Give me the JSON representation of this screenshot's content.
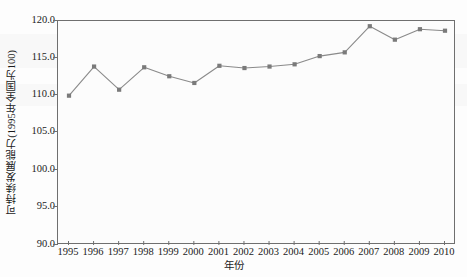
{
  "chart_data": {
    "type": "line",
    "title": "",
    "xlabel": "年份",
    "ylabel": "可持续发展能力(1995年全国为100)",
    "categories": [
      "1995",
      "1996",
      "1997",
      "1998",
      "1999",
      "2000",
      "2001",
      "2002",
      "2003",
      "2004",
      "2005",
      "2006",
      "2007",
      "2008",
      "2009",
      "2010"
    ],
    "values": [
      110.0,
      113.9,
      110.8,
      113.8,
      112.6,
      111.7,
      114.0,
      113.7,
      113.9,
      114.2,
      115.3,
      115.8,
      119.3,
      117.5,
      118.9,
      118.7
    ],
    "series": [
      {
        "name": "可持续发展能力",
        "values": [
          110.0,
          113.9,
          110.8,
          113.8,
          112.6,
          111.7,
          114.0,
          113.7,
          113.9,
          114.2,
          115.3,
          115.8,
          119.3,
          117.5,
          118.9,
          118.7
        ]
      }
    ],
    "ylim": [
      90.0,
      120.0
    ],
    "yticks": [
      90.0,
      95.0,
      100.0,
      105.0,
      110.0,
      115.0,
      120.0
    ],
    "ytick_labels": [
      "90.0",
      "95.0",
      "100.0",
      "105.0",
      "110.0",
      "115.0",
      "120.0"
    ],
    "xtick_labels": [
      "1995",
      "1996",
      "1997",
      "1998",
      "1999",
      "2000",
      "2001",
      "2002",
      "2003",
      "2004",
      "2005",
      "2006",
      "2007",
      "2008",
      "2009",
      "2010"
    ],
    "grid": false,
    "legend": "none",
    "marker": "square",
    "line_color": "#8a8a8a",
    "marker_color": "#7a7a7a",
    "axis_color": "#6f6f6f",
    "background_color": "#fcfcfc"
  },
  "axes": {
    "y_title": "可持续发展能力(1995年全国为100)",
    "x_title": "年份"
  }
}
